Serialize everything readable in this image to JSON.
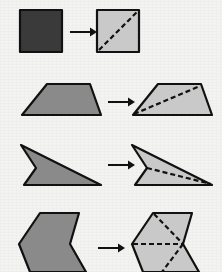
{
  "figure": {
    "background_color": "#f3f3f1",
    "colors": {
      "fill_dark": "#3a3a3a",
      "fill_medium": "#8a8a8a",
      "fill_light": "#c9c9c9",
      "stroke": "#111111",
      "dashed": "#111111",
      "arrow": "#111111"
    },
    "stroke_width": 2.2,
    "dash_pattern": "5,3",
    "arrow_symbol": "→"
  },
  "rows": [
    {
      "id": "row-1",
      "name": "square",
      "label": "Square",
      "arrow_label": "becomes",
      "diagonal_count": 1,
      "triangle_count": 2,
      "source": {
        "shape": "square",
        "fill": "#3a3a3a",
        "points": "20,10 62,10 62,52 20,52"
      },
      "result": {
        "shape": "square",
        "fill": "#c9c9c9",
        "points": "97,10 139,10 139,52 97,52",
        "diagonals": [
          {
            "x1": 99,
            "y1": 50,
            "x2": 137,
            "y2": 12
          }
        ]
      },
      "arrow": {
        "x1": 70,
        "y1": 32,
        "x2": 90,
        "y2": 32
      }
    },
    {
      "id": "row-2",
      "name": "trapezoid",
      "label": "Trapezoid",
      "arrow_label": "becomes",
      "diagonal_count": 1,
      "triangle_count": 2,
      "source": {
        "shape": "trapezoid",
        "fill": "#8a8a8a",
        "points": "47,84 90,84 101,115 22,115"
      },
      "result": {
        "shape": "trapezoid",
        "fill": "#c9c9c9",
        "points": "158,84 201,84 212,115 133,115",
        "diagonals": [
          {
            "x1": 134,
            "y1": 114,
            "x2": 200,
            "y2": 86
          }
        ]
      },
      "arrow": {
        "x1": 108,
        "y1": 102,
        "x2": 128,
        "y2": 102
      }
    },
    {
      "id": "row-3",
      "name": "dart",
      "label": "Concave dart",
      "arrow_label": "becomes",
      "diagonal_count": 1,
      "triangle_count": 2,
      "source": {
        "shape": "dart",
        "fill": "#8a8a8a",
        "points": "21,145 101,185 24,185 36,168"
      },
      "result": {
        "shape": "dart",
        "fill": "#c9c9c9",
        "points": "132,145 212,185 135,185 147,168"
      },
      "result_diagonals": [
        {
          "x1": 147,
          "y1": 168,
          "x2": 211,
          "y2": 184
        }
      ],
      "arrow": {
        "x1": 108,
        "y1": 165,
        "x2": 128,
        "y2": 165
      }
    },
    {
      "id": "row-4",
      "name": "chevron",
      "label": "Chevron",
      "arrow_label": "becomes",
      "diagonal_count": 3,
      "triangle_count": 4,
      "source": {
        "shape": "chevron",
        "fill": "#8a8a8a",
        "points": "40,213 79,213 70,244 86,272 30,272 19,244"
      },
      "result": {
        "shape": "chevron",
        "fill": "#c9c9c9",
        "points": "153,213 192,213 183,244 199,272 143,272 132,244"
      },
      "result_diagonals": [
        {
          "x1": 154,
          "y1": 214,
          "x2": 183,
          "y2": 244
        },
        {
          "x1": 133,
          "y1": 244,
          "x2": 183,
          "y2": 244
        },
        {
          "x1": 183,
          "y1": 244,
          "x2": 162,
          "y2": 272
        }
      ],
      "arrow": {
        "x1": 98,
        "y1": 248,
        "x2": 118,
        "y2": 248
      }
    }
  ]
}
